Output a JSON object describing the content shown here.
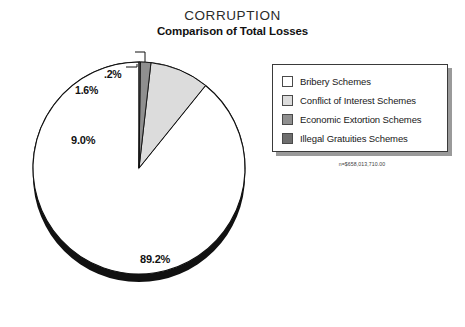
{
  "header": {
    "title": "CORRUPTION",
    "subtitle": "Comparison of Total Losses"
  },
  "legend": {
    "items": [
      {
        "label": "Bribery Schemes",
        "color": "#ffffff"
      },
      {
        "label": "Conflict of Interest Schemes",
        "color": "#dcdcdc"
      },
      {
        "label": "Economic Extortion Schemes",
        "color": "#8f8f8f"
      },
      {
        "label": "Illegal Gratuities Schemes",
        "color": "#6e6e6e"
      }
    ]
  },
  "footnote": {
    "n_label": "n=$658,013,710.00"
  },
  "labels": {
    "bribery": "89.2%",
    "conflict": "9.0%",
    "extortion": "1.6%",
    "gratuity": ".2%"
  },
  "chart_data": {
    "type": "pie",
    "title": "CORRUPTION",
    "subtitle": "Comparison of Total Losses",
    "categories": [
      "Bribery Schemes",
      "Conflict of Interest Schemes",
      "Economic Extortion Schemes",
      "Illegal Gratuities Schemes"
    ],
    "values": [
      89.2,
      9.0,
      1.6,
      0.2
    ],
    "value_labels": [
      "89.2%",
      "9.0%",
      "1.6%",
      ".2%"
    ],
    "slice_colors": [
      "#ffffff",
      "#dcdcdc",
      "#8f8f8f",
      "#6e6e6e"
    ],
    "units": "percent",
    "total_label": "n=$658,013,710.00",
    "legend_position": "right",
    "start_angle_deg": 0,
    "direction": "counterclockwise",
    "three_d": true,
    "grid": false
  }
}
